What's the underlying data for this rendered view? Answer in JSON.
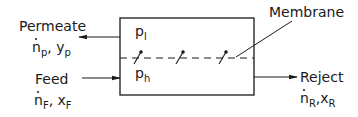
{
  "diagram": {
    "streams": {
      "permeate": {
        "label": "Permeate",
        "flow_symbol": "n",
        "flow_sub": "p",
        "comp_symbol": "y",
        "comp_sub": "p",
        "sep": ", "
      },
      "feed": {
        "label": "Feed",
        "flow_symbol": "n",
        "flow_sub": "F",
        "comp_symbol": "x",
        "comp_sub": "F",
        "sep": ", "
      },
      "reject": {
        "label": "Reject",
        "flow_symbol": "n",
        "flow_sub": "R",
        "comp_symbol": "x",
        "comp_sub": "R",
        "sep": ","
      }
    },
    "pressures": {
      "low": {
        "symbol": "p",
        "sub": "l"
      },
      "high": {
        "symbol": "p",
        "sub": "h"
      }
    },
    "membrane_label": "Membrane",
    "colors": {
      "line": "#1a1a1a",
      "background": "#ffffff"
    }
  }
}
